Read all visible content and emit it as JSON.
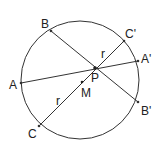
{
  "diagram": {
    "circle": {
      "cx": 80,
      "cy": 80,
      "r": 59
    },
    "chords": [
      {
        "from": "A",
        "to": "A'"
      },
      {
        "from": "B",
        "to": "B'"
      },
      {
        "from": "C",
        "to": "C'"
      }
    ],
    "points": {
      "A": {
        "x": 21,
        "y": 83,
        "label": "A"
      },
      "A_prime": {
        "x": 138,
        "y": 61,
        "label": "A'"
      },
      "B": {
        "x": 51,
        "y": 31,
        "label": "B"
      },
      "B_prime": {
        "x": 138,
        "y": 102,
        "label": "B'"
      },
      "C": {
        "x": 39,
        "y": 126,
        "label": "C"
      },
      "C_prime": {
        "x": 124,
        "y": 41,
        "label": "C'"
      },
      "P": {
        "x": 95,
        "y": 68,
        "label": "P"
      },
      "M": {
        "x": 82,
        "y": 82,
        "label": "M"
      }
    },
    "segment_labels": [
      {
        "text": "r",
        "x": 101,
        "y": 58
      },
      {
        "text": "r",
        "x": 56,
        "y": 105
      }
    ]
  }
}
